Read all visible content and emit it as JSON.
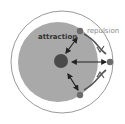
{
  "diagram": {
    "labels": {
      "attraction": "attraction",
      "repulsion": "repulsion"
    },
    "colors": {
      "outer_fill": "#ffffff",
      "outer_stroke": "#9a9a9a",
      "inner_fill": "#a9a9a9",
      "center_dot": "#4a4a4a",
      "particle": "#6b6b6b",
      "arrow": "#222222",
      "repulsion_text": "#8a8a8a",
      "attraction_text": "#333333"
    }
  }
}
